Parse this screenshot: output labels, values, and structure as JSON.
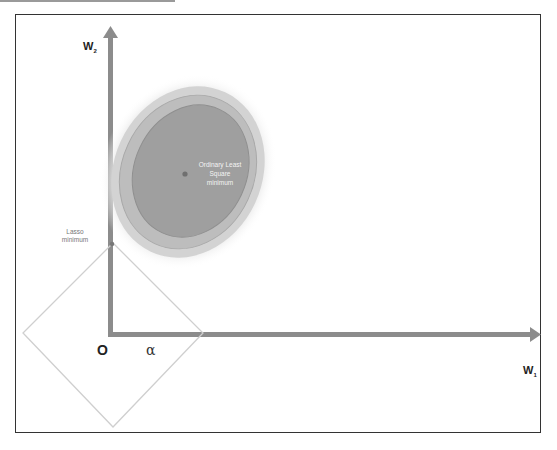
{
  "diagram": {
    "axes": {
      "x_label": "W",
      "x_subscript": "1",
      "y_label": "W",
      "y_subscript": "2",
      "origin_label": "O",
      "alpha_label": "α"
    },
    "annotations": {
      "ols_line1": "Ordinary Least",
      "ols_line2": "Square",
      "ols_line3": "minimum",
      "lasso_line1": "Lasso",
      "lasso_line2": "minimum"
    },
    "colors": {
      "axis": "#8c8c8c",
      "frame": "#333333",
      "diamond": "#cfcfcf",
      "ellipse_inner": "#9e9e9e",
      "ellipse_mid": "#b4b4b4",
      "ellipse_outer": "#cdcdcd",
      "ellipse_glow": "#e6e6e6",
      "point": "#707070"
    }
  }
}
